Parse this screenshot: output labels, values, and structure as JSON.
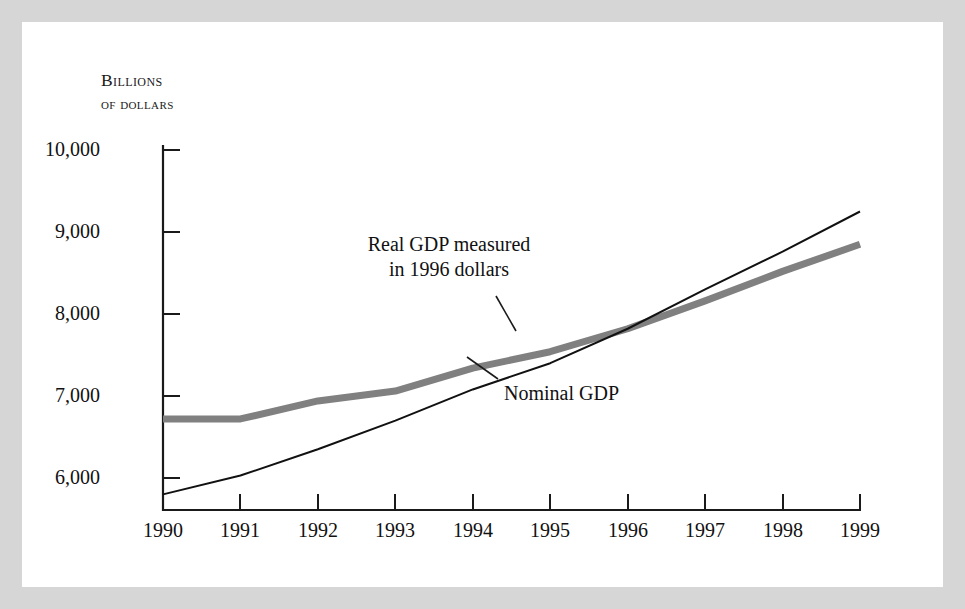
{
  "figure": {
    "background_color": "#ffffff",
    "frame_color": "#d6d6d6"
  },
  "axis": {
    "unit_label_line1": "Billions",
    "unit_label_line2": "of dollars",
    "y_ticks": [
      "10,000",
      "9,000",
      "8,000",
      "7,000",
      "6,000"
    ],
    "x_ticks": [
      "1990",
      "1991",
      "1992",
      "1993",
      "1994",
      "1995",
      "1996",
      "1997",
      "1998",
      "1999"
    ]
  },
  "annotations": {
    "real_gdp_line1": "Real GDP measured",
    "real_gdp_line2": "in 1996 dollars",
    "nominal_gdp": "Nominal GDP"
  },
  "chart_data": {
    "type": "line",
    "title": "",
    "xlabel": "",
    "ylabel": "Billions of dollars",
    "x": [
      1990,
      1991,
      1992,
      1993,
      1994,
      1995,
      1996,
      1997,
      1998,
      1999
    ],
    "xlim": [
      1990,
      1999
    ],
    "ylim": [
      5600,
      10000
    ],
    "y_tick_values": [
      10000,
      9000,
      8000,
      7000,
      6000
    ],
    "grid": false,
    "legend": "annotated-inline",
    "series": [
      {
        "name": "Real GDP measured in 1996 dollars",
        "color": "#808080",
        "line_width": 7,
        "values": [
          6720,
          6720,
          6940,
          7060,
          7340,
          7540,
          7820,
          8160,
          8520,
          8850
        ]
      },
      {
        "name": "Nominal GDP",
        "color": "#111111",
        "line_width": 2,
        "values": [
          5800,
          6030,
          6350,
          6700,
          7080,
          7400,
          7820,
          8300,
          8760,
          9250
        ]
      }
    ],
    "annotations": [
      {
        "label": "Real GDP measured in 1996 dollars",
        "points_to_series": "Real GDP measured in 1996 dollars",
        "points_to_x": 1994.6
      },
      {
        "label": "Nominal GDP",
        "points_to_series": "Nominal GDP",
        "points_to_x": 1994.2
      }
    ]
  }
}
